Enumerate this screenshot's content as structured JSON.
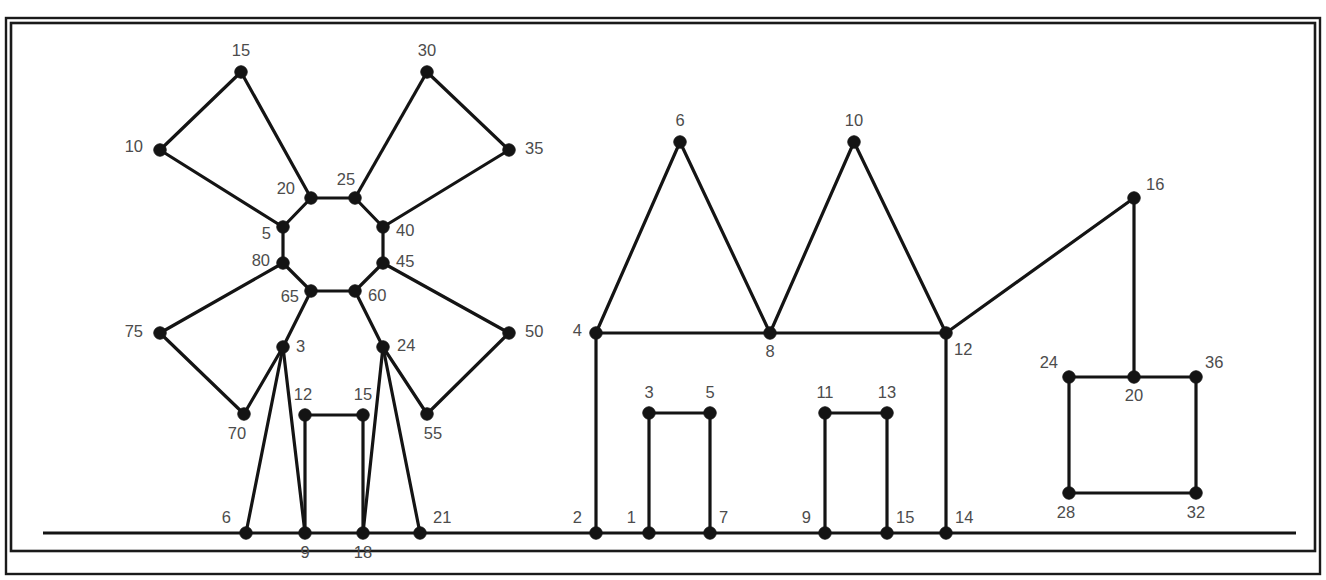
{
  "figure": {
    "kind": "node-link-graph-diagram",
    "background_color": "#ffffff",
    "line_color": "#141414",
    "label_color": "#4c4c4c",
    "node_radius": 6.2,
    "frame": {
      "outer": {
        "x": 6,
        "y": 18,
        "w": 1314,
        "h": 556,
        "stroke_width": 2.4
      },
      "inner": {
        "x": 11,
        "y": 23,
        "w": 1304,
        "h": 528,
        "stroke_width": 2.6
      }
    },
    "baseline": {
      "x1": 43,
      "y1": 533,
      "x2": 1296,
      "y2": 533
    }
  },
  "chart_data": {
    "type": "graph",
    "title": "",
    "clusters": [
      {
        "name": "left-flower-octagon-cluster"
      },
      {
        "name": "center-zigzag-bracket-cluster"
      },
      {
        "name": "right-square-cluster"
      }
    ],
    "nodes": [
      {
        "id": "n-15",
        "label": "15",
        "x": 241,
        "y": 72,
        "lx": 241,
        "ly": 52,
        "anchor": "mid",
        "cluster": 0
      },
      {
        "id": "n-30",
        "label": "30",
        "x": 427,
        "y": 72,
        "lx": 427,
        "ly": 52,
        "anchor": "mid",
        "cluster": 0
      },
      {
        "id": "n-10",
        "label": "10",
        "x": 160,
        "y": 150,
        "lx": 143,
        "ly": 148,
        "anchor": "end",
        "cluster": 0
      },
      {
        "id": "n-35",
        "label": "35",
        "x": 509,
        "y": 150,
        "lx": 525,
        "ly": 150,
        "anchor": "start",
        "cluster": 0
      },
      {
        "id": "n-20",
        "label": "20",
        "x": 311,
        "y": 198,
        "lx": 295,
        "ly": 190,
        "anchor": "end",
        "cluster": 0
      },
      {
        "id": "n-25",
        "label": "25",
        "x": 355,
        "y": 198,
        "lx": 346,
        "ly": 181,
        "anchor": "mid",
        "cluster": 0
      },
      {
        "id": "n-5",
        "label": "5",
        "x": 283,
        "y": 227,
        "lx": 271,
        "ly": 235,
        "anchor": "end",
        "cluster": 0
      },
      {
        "id": "n-40",
        "label": "40",
        "x": 383,
        "y": 227,
        "lx": 396,
        "ly": 232,
        "anchor": "start",
        "cluster": 0
      },
      {
        "id": "n-80",
        "label": "80",
        "x": 283,
        "y": 263,
        "lx": 270,
        "ly": 262,
        "anchor": "end",
        "cluster": 0
      },
      {
        "id": "n-45",
        "label": "45",
        "x": 383,
        "y": 263,
        "lx": 396,
        "ly": 263,
        "anchor": "start",
        "cluster": 0
      },
      {
        "id": "n-65",
        "label": "65",
        "x": 311,
        "y": 291,
        "lx": 299,
        "ly": 298,
        "anchor": "end",
        "cluster": 0
      },
      {
        "id": "n-60",
        "label": "60",
        "x": 355,
        "y": 291,
        "lx": 368,
        "ly": 297,
        "anchor": "start",
        "cluster": 0
      },
      {
        "id": "n-75",
        "label": "75",
        "x": 160,
        "y": 333,
        "lx": 143,
        "ly": 333,
        "anchor": "end",
        "cluster": 0
      },
      {
        "id": "n-50",
        "label": "50",
        "x": 509,
        "y": 333,
        "lx": 525,
        "ly": 333,
        "anchor": "start",
        "cluster": 0
      },
      {
        "id": "n-3",
        "label": "3",
        "x": 283,
        "y": 347,
        "lx": 296,
        "ly": 348,
        "anchor": "start",
        "cluster": 0
      },
      {
        "id": "n-24a",
        "label": "24",
        "x": 383,
        "y": 347,
        "lx": 397,
        "ly": 347,
        "anchor": "start",
        "cluster": 0
      },
      {
        "id": "n-70",
        "label": "70",
        "x": 244,
        "y": 414,
        "lx": 237,
        "ly": 435,
        "anchor": "mid",
        "cluster": 0
      },
      {
        "id": "n-55",
        "label": "55",
        "x": 427,
        "y": 414,
        "lx": 433,
        "ly": 435,
        "anchor": "mid",
        "cluster": 0
      },
      {
        "id": "n-12a",
        "label": "12",
        "x": 305,
        "y": 415,
        "lx": 303,
        "ly": 396,
        "anchor": "mid",
        "cluster": 0
      },
      {
        "id": "n-15b",
        "label": "15",
        "x": 363,
        "y": 415,
        "lx": 363,
        "ly": 396,
        "anchor": "mid",
        "cluster": 0
      },
      {
        "id": "n-6a",
        "label": "6",
        "x": 246,
        "y": 533,
        "lx": 231,
        "ly": 519,
        "anchor": "end",
        "cluster": 0
      },
      {
        "id": "n-9a",
        "label": "9",
        "x": 305,
        "y": 533,
        "lx": 305,
        "ly": 554,
        "anchor": "mid",
        "cluster": 0
      },
      {
        "id": "n-18",
        "label": "18",
        "x": 363,
        "y": 533,
        "lx": 363,
        "ly": 554,
        "anchor": "mid",
        "cluster": 0
      },
      {
        "id": "n-21",
        "label": "21",
        "x": 420,
        "y": 533,
        "lx": 433,
        "ly": 519,
        "anchor": "start",
        "cluster": 0
      },
      {
        "id": "n-6b",
        "label": "6",
        "x": 680,
        "y": 142,
        "lx": 680,
        "ly": 122,
        "anchor": "mid",
        "cluster": 1
      },
      {
        "id": "n-10b",
        "label": "10",
        "x": 854,
        "y": 142,
        "lx": 854,
        "ly": 122,
        "anchor": "mid",
        "cluster": 1
      },
      {
        "id": "n-4",
        "label": "4",
        "x": 596,
        "y": 333,
        "lx": 582,
        "ly": 332,
        "anchor": "end",
        "cluster": 1
      },
      {
        "id": "n-8",
        "label": "8",
        "x": 770,
        "y": 333,
        "lx": 770,
        "ly": 353,
        "anchor": "mid",
        "cluster": 1
      },
      {
        "id": "n-12b",
        "label": "12",
        "x": 946,
        "y": 333,
        "lx": 954,
        "ly": 351,
        "anchor": "start",
        "cluster": 1
      },
      {
        "id": "n-3b",
        "label": "3",
        "x": 649,
        "y": 413,
        "lx": 649,
        "ly": 394,
        "anchor": "mid",
        "cluster": 1
      },
      {
        "id": "n-5b",
        "label": "5",
        "x": 710,
        "y": 413,
        "lx": 710,
        "ly": 394,
        "anchor": "mid",
        "cluster": 1
      },
      {
        "id": "n-11",
        "label": "11",
        "x": 825,
        "y": 413,
        "lx": 825,
        "ly": 394,
        "anchor": "mid",
        "cluster": 1
      },
      {
        "id": "n-13",
        "label": "13",
        "x": 887,
        "y": 413,
        "lx": 887,
        "ly": 394,
        "anchor": "mid",
        "cluster": 1
      },
      {
        "id": "n-2",
        "label": "2",
        "x": 596,
        "y": 533,
        "lx": 582,
        "ly": 519,
        "anchor": "end",
        "cluster": 1
      },
      {
        "id": "n-1",
        "label": "1",
        "x": 649,
        "y": 533,
        "lx": 636,
        "ly": 519,
        "anchor": "end",
        "cluster": 1
      },
      {
        "id": "n-7",
        "label": "7",
        "x": 710,
        "y": 533,
        "lx": 719,
        "ly": 519,
        "anchor": "start",
        "cluster": 1
      },
      {
        "id": "n-9b",
        "label": "9",
        "x": 825,
        "y": 533,
        "lx": 811,
        "ly": 519,
        "anchor": "end",
        "cluster": 1
      },
      {
        "id": "n-15c",
        "label": "15",
        "x": 887,
        "y": 533,
        "lx": 896,
        "ly": 519,
        "anchor": "start",
        "cluster": 1
      },
      {
        "id": "n-14",
        "label": "14",
        "x": 946,
        "y": 533,
        "lx": 955,
        "ly": 519,
        "anchor": "start",
        "cluster": 1
      },
      {
        "id": "n-16",
        "label": "16",
        "x": 1134,
        "y": 198,
        "lx": 1146,
        "ly": 186,
        "anchor": "start",
        "cluster": 2
      },
      {
        "id": "n-24b",
        "label": "24",
        "x": 1069,
        "y": 377,
        "lx": 1058,
        "ly": 364,
        "anchor": "end",
        "cluster": 2
      },
      {
        "id": "n-20b",
        "label": "20",
        "x": 1134,
        "y": 377,
        "lx": 1134,
        "ly": 397,
        "anchor": "mid",
        "cluster": 2
      },
      {
        "id": "n-36",
        "label": "36",
        "x": 1196,
        "y": 377,
        "lx": 1205,
        "ly": 364,
        "anchor": "start",
        "cluster": 2
      },
      {
        "id": "n-28",
        "label": "28",
        "x": 1069,
        "y": 493,
        "lx": 1066,
        "ly": 514,
        "anchor": "mid",
        "cluster": 2
      },
      {
        "id": "n-32",
        "label": "32",
        "x": 1196,
        "y": 493,
        "lx": 1196,
        "ly": 514,
        "anchor": "mid",
        "cluster": 2
      }
    ],
    "edges": [
      [
        "n-5",
        "n-10"
      ],
      [
        "n-10",
        "n-15"
      ],
      [
        "n-15",
        "n-20"
      ],
      [
        "n-25",
        "n-30"
      ],
      [
        "n-30",
        "n-35"
      ],
      [
        "n-35",
        "n-40"
      ],
      [
        "n-20",
        "n-25"
      ],
      [
        "n-20",
        "n-5"
      ],
      [
        "n-5",
        "n-80"
      ],
      [
        "n-25",
        "n-40"
      ],
      [
        "n-40",
        "n-45"
      ],
      [
        "n-45",
        "n-60"
      ],
      [
        "n-60",
        "n-65"
      ],
      [
        "n-65",
        "n-80"
      ],
      [
        "n-80",
        "n-75"
      ],
      [
        "n-75",
        "n-70"
      ],
      [
        "n-70",
        "n-3"
      ],
      [
        "n-3",
        "n-65"
      ],
      [
        "n-45",
        "n-50"
      ],
      [
        "n-50",
        "n-55"
      ],
      [
        "n-55",
        "n-24a"
      ],
      [
        "n-24a",
        "n-60"
      ],
      [
        "n-3",
        "n-6a"
      ],
      [
        "n-3",
        "n-9a"
      ],
      [
        "n-24a",
        "n-18"
      ],
      [
        "n-24a",
        "n-21"
      ],
      [
        "n-12a",
        "n-15b"
      ],
      [
        "n-12a",
        "n-9a"
      ],
      [
        "n-15b",
        "n-18"
      ],
      [
        "n-4",
        "n-6b"
      ],
      [
        "n-6b",
        "n-8"
      ],
      [
        "n-8",
        "n-10b"
      ],
      [
        "n-10b",
        "n-12b"
      ],
      [
        "n-4",
        "n-8"
      ],
      [
        "n-8",
        "n-12b"
      ],
      [
        "n-4",
        "n-2"
      ],
      [
        "n-12b",
        "n-14"
      ],
      [
        "n-3b",
        "n-5b"
      ],
      [
        "n-3b",
        "n-1"
      ],
      [
        "n-5b",
        "n-7"
      ],
      [
        "n-11",
        "n-13"
      ],
      [
        "n-11",
        "n-9b"
      ],
      [
        "n-13",
        "n-15c"
      ],
      [
        "n-12b",
        "n-16"
      ],
      [
        "n-16",
        "n-20b"
      ],
      [
        "n-24b",
        "n-20b"
      ],
      [
        "n-20b",
        "n-36"
      ],
      [
        "n-24b",
        "n-28"
      ],
      [
        "n-36",
        "n-32"
      ],
      [
        "n-28",
        "n-32"
      ]
    ]
  }
}
